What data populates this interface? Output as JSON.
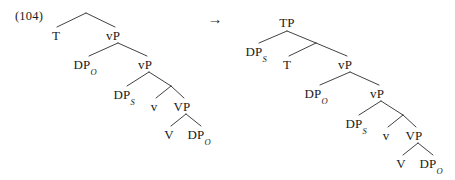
{
  "figure": {
    "example_number": "(104)",
    "arrow": "→",
    "arrow_label": "rightwards-arrow",
    "ink_color": "#2b2b2b",
    "background_color": "#ffffff"
  },
  "left_tree": {
    "name": "vP-shell-before-subject-raising",
    "nodes": [
      {
        "id": "L-T",
        "label": "T",
        "sub": "",
        "x": 56,
        "y": 29
      },
      {
        "id": "L-vP1",
        "label": "vP",
        "sub": "",
        "x": 113,
        "y": 29
      },
      {
        "id": "L-DPO1",
        "label": "DP",
        "sub": "O",
        "x": 85,
        "y": 58
      },
      {
        "id": "L-vP2",
        "label": "vP",
        "sub": "",
        "x": 145,
        "y": 58
      },
      {
        "id": "L-DPS",
        "label": "DP",
        "sub": "S",
        "x": 124,
        "y": 88
      },
      {
        "id": "L-v",
        "label": "v",
        "sub": "",
        "x": 154,
        "y": 100
      },
      {
        "id": "L-VP",
        "label": "VP",
        "sub": "",
        "x": 182,
        "y": 100
      },
      {
        "id": "L-V",
        "label": "V",
        "sub": "",
        "x": 169,
        "y": 128
      },
      {
        "id": "L-DPO2",
        "label": "DP",
        "sub": "O",
        "x": 199,
        "y": 128
      }
    ]
  },
  "right_tree": {
    "name": "TP-after-subject-raising",
    "nodes": [
      {
        "id": "R-TP",
        "label": "TP",
        "sub": "",
        "x": 287,
        "y": 16
      },
      {
        "id": "R-DPS1",
        "label": "DP",
        "sub": "S",
        "x": 256,
        "y": 45
      },
      {
        "id": "R-T",
        "label": "T",
        "sub": "",
        "x": 287,
        "y": 58
      },
      {
        "id": "R-vP1",
        "label": "vP",
        "sub": "",
        "x": 345,
        "y": 58
      },
      {
        "id": "R-DPO1",
        "label": "DP",
        "sub": "O",
        "x": 316,
        "y": 87
      },
      {
        "id": "R-vP2",
        "label": "vP",
        "sub": "",
        "x": 377,
        "y": 87
      },
      {
        "id": "R-DPS2",
        "label": "DP",
        "sub": "S",
        "x": 356,
        "y": 117
      },
      {
        "id": "R-v",
        "label": "v",
        "sub": "",
        "x": 386,
        "y": 129
      },
      {
        "id": "R-VP",
        "label": "VP",
        "sub": "",
        "x": 414,
        "y": 129
      },
      {
        "id": "R-V",
        "label": "V",
        "sub": "",
        "x": 401,
        "y": 157
      },
      {
        "id": "R-DPO2",
        "label": "DP",
        "sub": "O",
        "x": 431,
        "y": 157
      }
    ]
  }
}
